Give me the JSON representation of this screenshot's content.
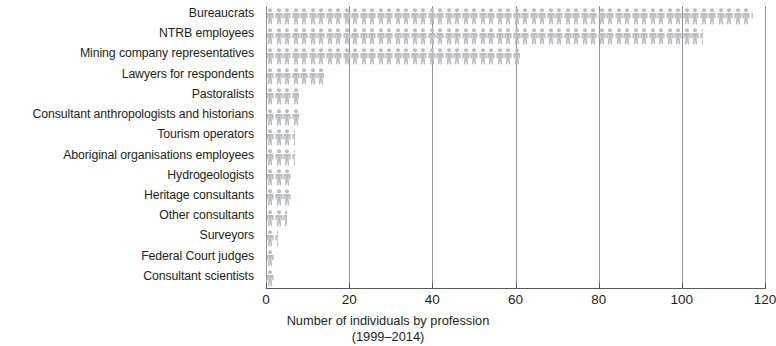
{
  "chart_data": {
    "type": "bar",
    "orientation": "horizontal",
    "style": "pictogram",
    "title": "",
    "subtitle": "",
    "xlabel_lines": [
      "Number of individuals by profession",
      "(1999–2014)"
    ],
    "ylabel": "",
    "categories": [
      "Bureaucrats",
      "NTRB employees",
      "Mining company representatives",
      "Lawyers for respondents",
      "Pastoralists",
      "Consultant anthropologists and historians",
      "Tourism operators",
      "Aboriginal organisations employees",
      "Hydrogeologists",
      "Heritage consultants",
      "Other consultants",
      "Surveyors",
      "Federal Court judges",
      "Consultant scientists"
    ],
    "values": [
      117,
      105,
      61,
      14,
      8,
      8,
      7,
      7,
      6,
      6,
      5,
      3,
      2,
      2
    ],
    "xlim": [
      0,
      120
    ],
    "xticks": [
      0,
      20,
      40,
      60,
      80,
      100,
      120
    ],
    "xticklabels": [
      "0",
      "20",
      "40",
      "60",
      "80",
      "100",
      "120"
    ],
    "grid": "vertical",
    "legend": null,
    "colors": {
      "figure": "#b9bdc1",
      "grid": "#808285",
      "axis": "#58595b",
      "text": "#231f20",
      "background": "#ffffff"
    }
  }
}
